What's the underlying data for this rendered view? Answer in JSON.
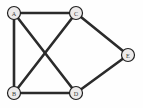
{
  "figure": {
    "name": "undirected-graph-diagram",
    "background_color": "#fefefe",
    "width": 143,
    "height": 108
  },
  "style": {
    "edge_color": "#2b2b2b",
    "edge_width": 2.6,
    "node_fill": "#eceaea",
    "node_stroke": "#1f1f1f",
    "node_radius": 6.5,
    "label_color": "#3a3a3a"
  },
  "chart_data": {
    "type": "diagram",
    "graph_type": "undirected",
    "title": "",
    "node_count": 5,
    "edge_count": 7,
    "nodes": [
      {
        "id": "A",
        "label": "A",
        "x": 14,
        "y": 13
      },
      {
        "id": "C",
        "label": "C",
        "x": 76,
        "y": 13
      },
      {
        "id": "E",
        "label": "E",
        "x": 128,
        "y": 55
      },
      {
        "id": "B",
        "label": "B",
        "x": 14,
        "y": 93
      },
      {
        "id": "D",
        "label": "D",
        "x": 76,
        "y": 93
      }
    ],
    "edges": [
      {
        "source": "A",
        "target": "C",
        "x1": 14,
        "y1": 13,
        "x2": 76,
        "y2": 13
      },
      {
        "source": "A",
        "target": "B",
        "x1": 14,
        "y1": 13,
        "x2": 14,
        "y2": 93
      },
      {
        "source": "A",
        "target": "D",
        "x1": 14,
        "y1": 13,
        "x2": 76,
        "y2": 93
      },
      {
        "source": "B",
        "target": "C",
        "x1": 14,
        "y1": 93,
        "x2": 76,
        "y2": 13
      },
      {
        "source": "B",
        "target": "D",
        "x1": 14,
        "y1": 93,
        "x2": 76,
        "y2": 93
      },
      {
        "source": "C",
        "target": "E",
        "x1": 76,
        "y1": 13,
        "x2": 128,
        "y2": 55
      },
      {
        "source": "D",
        "target": "E",
        "x1": 76,
        "y1": 93,
        "x2": 128,
        "y2": 55
      }
    ]
  }
}
